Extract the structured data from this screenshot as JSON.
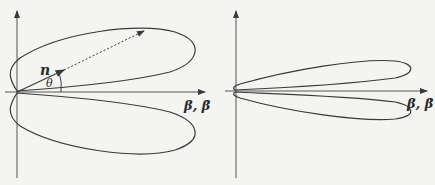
{
  "panels": [
    {
      "id": "left",
      "description": "Radiation pattern lobes at low velocity with unit vector n at angle theta",
      "axis_label": "β, β̇",
      "vector_label": "n",
      "angle_label": "θ"
    },
    {
      "id": "right",
      "description": "Radiation pattern lobes at high velocity, narrow forward-beamed lobes",
      "axis_label": "β, β̇"
    }
  ],
  "colors": {
    "background": "#f4f4f2",
    "stroke": "#3a3a3a"
  }
}
